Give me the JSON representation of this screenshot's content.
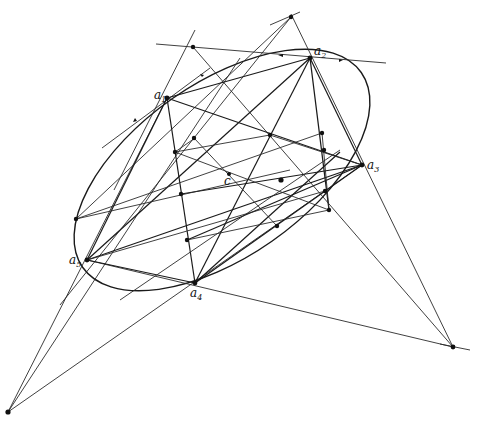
{
  "figure": {
    "type": "projective-geometry-construction",
    "stroke_color": "#1a1a1a",
    "background": "#ffffff"
  },
  "labels": {
    "a1": {
      "base": "a",
      "sub": "1"
    },
    "a2": {
      "base": "a",
      "sub": "2"
    },
    "a3": {
      "base": "a",
      "sub": "3"
    },
    "a4": {
      "base": "a",
      "sub": "4"
    },
    "a5": {
      "base": "a",
      "sub": "5"
    },
    "c": {
      "base": "c",
      "sub": ""
    }
  },
  "points": {
    "a1": [
      167,
      98
    ],
    "a2": [
      310,
      58
    ],
    "a3": [
      362,
      165
    ],
    "a4": [
      195,
      283
    ],
    "a5": [
      87,
      260
    ],
    "c": [
      229,
      174
    ]
  }
}
